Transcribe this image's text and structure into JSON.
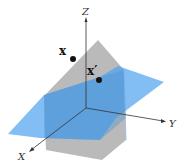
{
  "diagram": {
    "axes": {
      "x_label": "X",
      "y_label": "Y",
      "z_label": "Z"
    },
    "points": [
      {
        "label": "x",
        "cx": 73,
        "cy": 59
      },
      {
        "label": "x′",
        "cx": 99,
        "cy": 80
      }
    ],
    "planes": {
      "gray_color": "#9e9e9e",
      "blue_color": "#5aa9ee"
    }
  }
}
